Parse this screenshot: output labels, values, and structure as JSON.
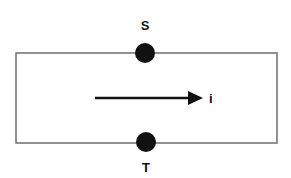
{
  "diagram": {
    "type": "circuit-loop",
    "colors": {
      "background": "#ffffff",
      "wire": "#6e6e6e",
      "node": "#111111",
      "arrow": "#111111",
      "text": "#111111"
    },
    "loop": {
      "x": 16,
      "y": 53,
      "width": 261,
      "height": 90
    },
    "nodes": [
      {
        "id": "S",
        "label": "S",
        "cx": 145,
        "cy": 53,
        "r": 10,
        "label_x": 145,
        "label_y": 30
      },
      {
        "id": "T",
        "label": "T",
        "cx": 146,
        "cy": 142,
        "r": 10,
        "label_x": 146,
        "label_y": 172
      }
    ],
    "current_arrow": {
      "label": "i",
      "x1": 95,
      "y1": 98,
      "x2": 203,
      "y2": 98,
      "label_x": 209,
      "label_y": 103,
      "direction": "right"
    }
  }
}
